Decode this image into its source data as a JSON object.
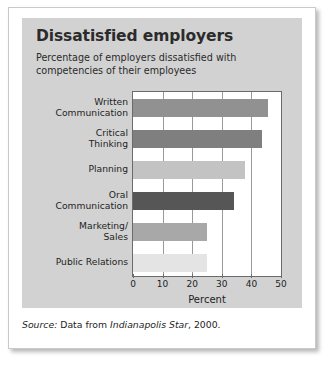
{
  "figure": {
    "title": "Dissatisfied employers",
    "subtitle": "Percentage of employers dissatisfied with competencies of their employees",
    "source": {
      "prefix": "Source:",
      "text_before": "Data from",
      "publication": "Indianapolis Star",
      "text_after": ", 2000."
    }
  },
  "chart_data": {
    "type": "bar",
    "orientation": "horizontal",
    "title": "Dissatisfied employers",
    "subtitle": "Percentage of employers dissatisfied with competencies of their employees",
    "xlabel": "Percent",
    "ylabel": "",
    "xlim": [
      0,
      50
    ],
    "xticks": [
      0,
      10,
      20,
      30,
      40,
      50
    ],
    "grid": true,
    "legend": false,
    "categories": [
      "Written Communication",
      "Critical Thinking",
      "Planning",
      "Oral Communication",
      "Marketing/ Sales",
      "Public Relations"
    ],
    "category_lines": [
      [
        "Written",
        "Communication"
      ],
      [
        "Critical",
        "Thinking"
      ],
      [
        "Planning"
      ],
      [
        "Oral",
        "Communication"
      ],
      [
        "Marketing/",
        "Sales"
      ],
      [
        "Public Relations"
      ]
    ],
    "values": [
      45.5,
      43.5,
      38,
      34,
      25,
      25
    ],
    "bar_colors": [
      "#919191",
      "#7f7f7f",
      "#c3c3c3",
      "#565656",
      "#a8a8a8",
      "#e4e4e4"
    ]
  },
  "colors": {
    "panel_background": "#d2d2d2",
    "plot_background": "#ffffff",
    "axis": "#6b6b6b",
    "gridline": "#9a9a9a",
    "text": "#1e1e1e"
  }
}
